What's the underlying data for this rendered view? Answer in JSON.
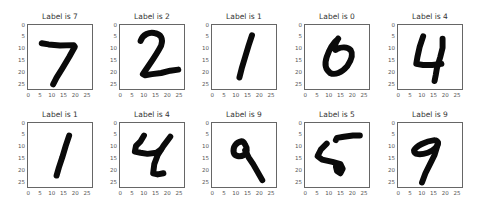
{
  "chart_data": {
    "type": "image-grid",
    "title": "",
    "layout": {
      "rows": 2,
      "cols": 5
    },
    "xticks": [
      "0",
      "5",
      "10",
      "15",
      "20",
      "25"
    ],
    "yticks": [
      "0",
      "5",
      "10",
      "15",
      "20",
      "25"
    ],
    "xlim": [
      0,
      27
    ],
    "ylim": [
      27,
      0
    ],
    "colormap": "gray_r",
    "panels": [
      {
        "title": "Label is 7",
        "label": 7,
        "strokes": [
          "M6,8 L9,8.5 L14,9 L20,8.8 L20.5,9.5 L18,14 L15,19 L12.5,23 L11,26"
        ]
      },
      {
        "title": "Label is 2",
        "label": 2,
        "strokes": [
          "M9,7 C10,4 13,3 15,3.5 C18,4 19,6 18,9 C16,13 13,17 10,21.5 L11,22 L14,21.5 L18,21 L22,20 L25.5,19.5"
        ]
      },
      {
        "title": "Label is 1",
        "label": 1,
        "strokes": [
          "M17.5,4.5 L16,9 L14.5,14 L13,19 L12,23"
        ]
      },
      {
        "title": "Label is 0",
        "label": 0,
        "strokes": [
          "M14.5,6 C12,8 10.5,11 9.5,14 C8.5,17 9,19.5 11,21 C13,22 16,21 18.5,18 C20.5,15 21,12.5 20,11 C18.5,9.5 16,9.5 14,10.5 C12.5,12 12.5,9 14.5,6"
        ]
      },
      {
        "title": "Label is 4",
        "label": 4,
        "strokes": [
          "M11,5 L9.5,9.5 L8.5,14 L8,17 L11,17.5 L15,17.5 L19,17",
          "M19.5,6 L19.5,10 L18.5,14 L17,19 L16.5,22 L16,24.5"
        ]
      },
      {
        "title": "Label is 1",
        "label": 1,
        "strokes": [
          "M18,5.5 L16.5,10 L15,15 L13.5,19.5 L12.5,23"
        ]
      },
      {
        "title": "Label is 4",
        "label": 4,
        "strokes": [
          "M10.5,5.5 L9,8 L7,10 L6.5,12.5 L9,13 L12,13.5 L16,13 L18,11.5",
          "M22,6 L19,10 L16.5,14 L15,18 L14.5,22 L16.5,22.5 L19,22"
        ]
      },
      {
        "title": "Label is 9",
        "label": 9,
        "strokes": [
          "M13,8 C10.5,8.5 9,10.5 9.5,13 C10,14.5 12,15 14,14 C15.5,13 15.5,11 14.5,9.5 C14,8.5 13.5,8 13,8",
          "M14.5,12 L16,15 L18,18 L20,21.5 L22,25"
        ]
      },
      {
        "title": "Label is 5",
        "label": 5,
        "strokes": [
          "M13.5,7.5 L14,6.5 L17,6 L21,5.5 L24,5.5",
          "M9.5,9 L7,11.5 L5.5,14.5 L7.5,16 L12,17 L15.5,18 L16.5,20 L15.5,22 L14,21 L13.5,19 L15,18"
        ]
      },
      {
        "title": "Label is 9",
        "label": 9,
        "strokes": [
          "M16,7.5 C12,8 8,10 7,12 C7,14 10,14 13,13 C16,12 17.5,10 17.5,8.5 C17,7.5 16.5,7.5 16,7.5",
          "M17.5,9 L16,14 L14,18 L12,22 L10.5,26"
        ]
      }
    ]
  }
}
